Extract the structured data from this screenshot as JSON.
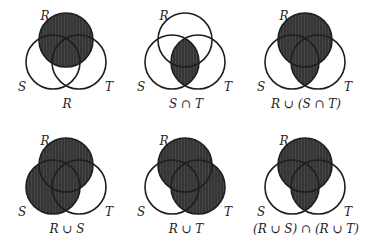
{
  "figure": {
    "colors": {
      "shade": "#353535",
      "outline": "#1e1e1e",
      "background": "#ffffff"
    },
    "set_names": [
      "R",
      "S",
      "T"
    ],
    "panels": [
      {
        "id": "r",
        "caption": "R",
        "shaded_sets_expression": "R",
        "shaded": [
          "R"
        ]
      },
      {
        "id": "s-cap-t",
        "caption": "S ∩ T",
        "shaded_sets_expression": "S ∩ T",
        "shaded": [
          "S∩T"
        ]
      },
      {
        "id": "r-cup-s-cap-t",
        "caption": "R ∪ (S ∩ T)",
        "shaded_sets_expression": "R ∪ (S ∩ T)",
        "shaded": [
          "R",
          "S∩T"
        ]
      },
      {
        "id": "r-cup-s",
        "caption": "R ∪ S",
        "shaded_sets_expression": "R ∪ S",
        "shaded": [
          "R",
          "S"
        ]
      },
      {
        "id": "r-cup-t",
        "caption": "R ∪ T",
        "shaded_sets_expression": "R ∪ T",
        "shaded": [
          "R",
          "T"
        ]
      },
      {
        "id": "r-cup-s-cap-r-cup-t",
        "caption": "(R ∪ S) ∩ (R ∪ T)",
        "shaded_sets_expression": "(R ∪ S) ∩ (R ∪ T)",
        "shaded": [
          "R",
          "S∩T"
        ]
      }
    ]
  }
}
